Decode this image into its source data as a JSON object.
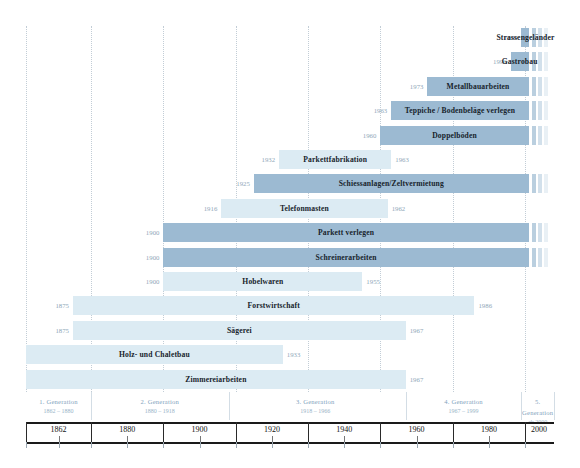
{
  "chart_data": {
    "type": "bar",
    "title": "",
    "xlabel": "",
    "ylabel": "",
    "xlim": [
      1862,
      2008
    ],
    "grid": true,
    "orientation": "horizontal",
    "legend": "none",
    "colors": {
      "ongoing": "#9cbad2",
      "ended": "#dcebf3",
      "year_label": "#8fa7b8",
      "generation_text": "#7fa3bd",
      "axis": "#1a1a1a"
    },
    "axis_ticks": [
      1862,
      1880,
      1900,
      1920,
      1940,
      1960,
      1980,
      2000
    ],
    "categories": [
      "Strassengeländer",
      "Gastrobau",
      "Metallbauarbeiten",
      "Teppiche / Bodenbeläge verlegen",
      "Doppelböden",
      "Parkettfabrikation",
      "Schiessanlagen/Zeltvermietung",
      "Telefonmasten",
      "Parkett verlegen",
      "Schreinerarbeiten",
      "Hobelwaren",
      "Forstwirtschaft",
      "Sägerei",
      "Holz- und Chaletbau",
      "Zimmereiarbeiten"
    ],
    "bars": [
      {
        "label": "Strassengeländer",
        "start": 1999,
        "end": null,
        "start_text": "1999",
        "end_text": "",
        "ongoing": true,
        "shade": "ongoing"
      },
      {
        "label": "Gastrobau",
        "start": 1996,
        "end": null,
        "start_text": "1996",
        "end_text": "",
        "ongoing": true,
        "shade": "ongoing"
      },
      {
        "label": "Metallbauarbeiten",
        "start": 1973,
        "end": null,
        "start_text": "1973",
        "end_text": "",
        "ongoing": true,
        "shade": "ongoing"
      },
      {
        "label": "Teppiche / Bodenbeläge verlegen",
        "start": 1963,
        "end": null,
        "start_text": "1963",
        "end_text": "",
        "ongoing": true,
        "shade": "ongoing"
      },
      {
        "label": "Doppelböden",
        "start": 1960,
        "end": null,
        "start_text": "1960",
        "end_text": "",
        "ongoing": true,
        "shade": "ongoing"
      },
      {
        "label": "Parkettfabrikation",
        "start": 1932,
        "end": 1963,
        "start_text": "1932",
        "end_text": "1963",
        "ongoing": false,
        "shade": "ended"
      },
      {
        "label": "Schiessanlagen/Zeltvermietung",
        "start": 1925,
        "end": null,
        "start_text": "1925",
        "end_text": "",
        "ongoing": true,
        "shade": "ongoing"
      },
      {
        "label": "Telefonmasten",
        "start": 1916,
        "end": 1962,
        "start_text": "1916",
        "end_text": "1962",
        "ongoing": false,
        "shade": "ended"
      },
      {
        "label": "Parkett verlegen",
        "start": 1900,
        "end": null,
        "start_text": "1900",
        "end_text": "",
        "ongoing": true,
        "shade": "ongoing"
      },
      {
        "label": "Schreinerarbeiten",
        "start": 1900,
        "end": null,
        "start_text": "1900",
        "end_text": "",
        "ongoing": true,
        "shade": "ongoing"
      },
      {
        "label": "Hobelwaren",
        "start": 1900,
        "end": 1955,
        "start_text": "1900",
        "end_text": "1955",
        "ongoing": false,
        "shade": "ended"
      },
      {
        "label": "Forstwirtschaft",
        "start": 1875,
        "end": 1986,
        "start_text": "1875",
        "end_text": "1986",
        "ongoing": false,
        "shade": "ended"
      },
      {
        "label": "Sägerei",
        "start": 1875,
        "end": 1967,
        "start_text": "1875",
        "end_text": "1967",
        "ongoing": false,
        "shade": "ended"
      },
      {
        "label": "Holz- und Chaletbau",
        "start": 1862,
        "end": 1933,
        "start_text": "",
        "end_text": "1933",
        "ongoing": false,
        "shade": "ended"
      },
      {
        "label": "Zimmereiarbeiten",
        "start": 1862,
        "end": 1967,
        "start_text": "",
        "end_text": "1967",
        "ongoing": false,
        "shade": "ended"
      }
    ],
    "generations": [
      {
        "name": "1. Generation",
        "years": "1862 – 1880",
        "from": 1862,
        "to": 1880
      },
      {
        "name": "2. Generation",
        "years": "1880 – 1918",
        "from": 1880,
        "to": 1918
      },
      {
        "name": "3. Generation",
        "years": "1918 – 1966",
        "from": 1918,
        "to": 1966
      },
      {
        "name": "4. Generation",
        "years": "1967 – 1999",
        "from": 1967,
        "to": 1999
      },
      {
        "name": "5. Generation",
        "years": "ab 2000",
        "from": 1999,
        "to": 2008
      }
    ]
  }
}
